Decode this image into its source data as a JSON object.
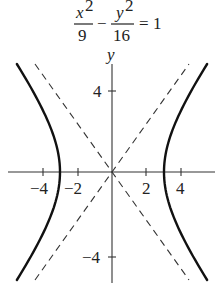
{
  "equation": {
    "term1_numerator": "x",
    "term1_numerator_exp": "2",
    "term1_denominator": "9",
    "operator": "−",
    "term2_numerator": "y",
    "term2_numerator_exp": "2",
    "term2_denominator": "16",
    "equals": "=",
    "rhs": "1"
  },
  "axes": {
    "y_label": "y",
    "x_ticks": [
      {
        "value": -4,
        "label": "−4"
      },
      {
        "value": -2,
        "label": "−2"
      },
      {
        "value": 2,
        "label": "2"
      },
      {
        "value": 4,
        "label": "4"
      }
    ],
    "y_ticks": [
      {
        "value": 4,
        "label": "4"
      },
      {
        "value": -4,
        "label": "−4"
      }
    ]
  },
  "chart_data": {
    "type": "line",
    "xlabel": "",
    "ylabel": "y",
    "xlim": [
      -6.5,
      6.2
    ],
    "ylim": [
      -5.4,
      5.2
    ],
    "grid": false,
    "series": [
      {
        "name": "hyperbola right branch",
        "style": "solid",
        "equation": "x = 3*sqrt(1 + y^2/16)",
        "vertex": [
          3,
          0
        ]
      },
      {
        "name": "hyperbola left branch",
        "style": "solid",
        "equation": "x = -3*sqrt(1 + y^2/16)",
        "vertex": [
          -3,
          0
        ]
      },
      {
        "name": "asymptote",
        "style": "dashed",
        "equation": "y = 4/3 x"
      },
      {
        "name": "asymptote",
        "style": "dashed",
        "equation": "y = -4/3 x"
      }
    ],
    "x_tick_values": [
      -4,
      -2,
      2,
      4
    ],
    "y_tick_values": [
      4,
      -4
    ]
  }
}
